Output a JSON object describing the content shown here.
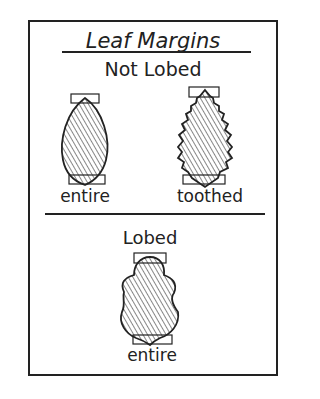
{
  "title": "Leaf Margins",
  "sections": [
    {
      "heading": "Not Lobed",
      "leaves": [
        {
          "label": "entire",
          "shape": "ovate-smooth"
        },
        {
          "label": "toothed",
          "shape": "ovate-serrated"
        }
      ]
    },
    {
      "heading": "Lobed",
      "leaves": [
        {
          "label": "entire",
          "shape": "lobed-smooth"
        }
      ]
    }
  ],
  "colors": {
    "ink": "#222222",
    "background": "#ffffff"
  }
}
